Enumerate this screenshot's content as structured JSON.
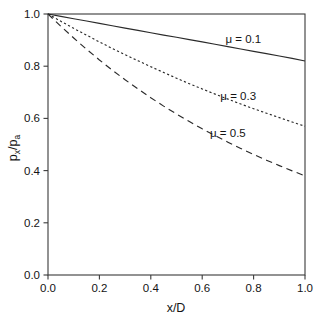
{
  "chart_data": {
    "type": "line",
    "title": "",
    "xlabel": "x/D",
    "ylabel": "px/pa",
    "ylabel_base": "p",
    "ylabel_sub1": "x",
    "ylabel_slash": "/p",
    "ylabel_sub2": "a",
    "xlim": [
      0.0,
      1.0
    ],
    "ylim": [
      0.0,
      1.0
    ],
    "grid": false,
    "legend_position": "inline-annotations",
    "xticks": [
      "0.0",
      "0.2",
      "0.4",
      "0.6",
      "0.8",
      "1.0"
    ],
    "xtick_values": [
      0.0,
      0.2,
      0.4,
      0.6,
      0.8,
      1.0
    ],
    "yticks": [
      "0.0",
      "0.2",
      "0.4",
      "0.6",
      "0.8",
      "1.0"
    ],
    "ytick_values": [
      0.0,
      0.2,
      0.4,
      0.6,
      0.8,
      1.0
    ],
    "x": [
      0.0,
      0.05,
      0.1,
      0.15,
      0.2,
      0.25,
      0.3,
      0.35,
      0.4,
      0.45,
      0.5,
      0.55,
      0.6,
      0.65,
      0.7,
      0.75,
      0.8,
      0.85,
      0.9,
      0.95,
      1.0
    ],
    "series": [
      {
        "name": "mu = 0.1",
        "label": "μ = 0.1",
        "linestyle": "solid",
        "dasharray": "",
        "color": "#2a2a2a",
        "label_x": 0.76,
        "label_y": 0.905,
        "values": [
          1.0,
          0.98,
          0.961,
          0.942,
          0.923,
          0.905,
          0.887,
          0.869,
          0.852,
          0.835,
          0.819,
          0.803,
          0.787,
          0.771,
          0.756,
          0.741,
          0.726,
          0.712,
          0.698,
          0.684,
          0.67
        ]
      },
      {
        "name": "mu = 0.3",
        "label": "μ = 0.3",
        "linestyle": "dotted",
        "dasharray": "2.2 2.4",
        "color": "#2a2a2a",
        "label_x": 0.74,
        "label_y": 0.685,
        "values": [
          1.0,
          0.942,
          0.887,
          0.835,
          0.787,
          0.741,
          0.698,
          0.657,
          0.619,
          0.583,
          0.549,
          0.517,
          0.487,
          0.458,
          0.432,
          0.407,
          0.383,
          0.361,
          0.34,
          0.32,
          0.301
        ]
      },
      {
        "name": "mu = 0.5",
        "label": "μ = 0.5",
        "linestyle": "dashed",
        "dasharray": "6.5 4.5",
        "color": "#2a2a2a",
        "label_x": 0.7,
        "label_y": 0.545,
        "values": [
          1.0,
          0.905,
          0.819,
          0.741,
          0.67,
          0.607,
          0.549,
          0.497,
          0.449,
          0.407,
          0.368,
          0.333,
          0.301,
          0.273,
          0.247,
          0.223,
          0.202,
          0.183,
          0.165,
          0.15,
          0.135
        ]
      }
    ],
    "plotted_series": [
      {
        "name": "mu = 0.1",
        "plot_values": [
          1.0,
          0.991,
          0.982,
          0.973,
          0.964,
          0.955,
          0.946,
          0.937,
          0.928,
          0.919,
          0.911,
          0.902,
          0.893,
          0.884,
          0.875,
          0.866,
          0.857,
          0.848,
          0.839,
          0.83,
          0.82
        ]
      },
      {
        "name": "mu = 0.3",
        "plot_values": [
          1.0,
          0.972,
          0.945,
          0.919,
          0.893,
          0.868,
          0.844,
          0.821,
          0.798,
          0.776,
          0.754,
          0.733,
          0.713,
          0.693,
          0.674,
          0.655,
          0.637,
          0.62,
          0.603,
          0.586,
          0.57
        ]
      },
      {
        "name": "mu = 0.5",
        "plot_values": [
          1.0,
          0.953,
          0.908,
          0.865,
          0.824,
          0.785,
          0.748,
          0.713,
          0.679,
          0.647,
          0.617,
          0.588,
          0.56,
          0.534,
          0.509,
          0.485,
          0.462,
          0.44,
          0.419,
          0.399,
          0.38
        ]
      }
    ],
    "axis_color": "#3a3a3a",
    "background_color": "#ffffff"
  }
}
